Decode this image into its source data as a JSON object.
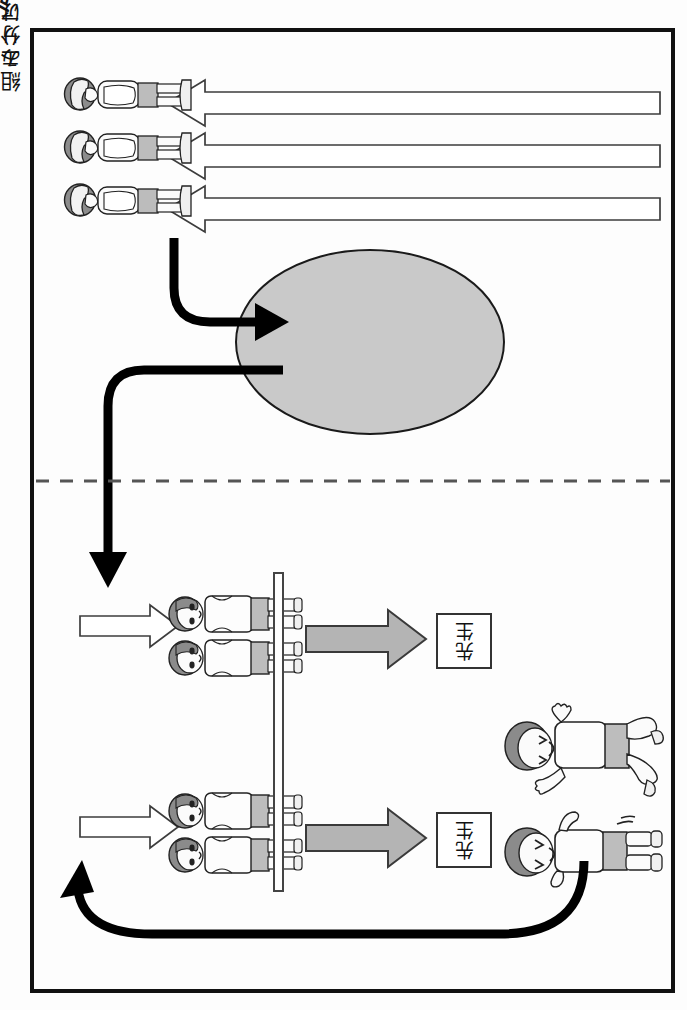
{
  "page": {
    "caption": "問題 1",
    "background_color": "#fdfdfd",
    "frame_color": "#111111"
  },
  "diagram": {
    "sorting_area": {
      "label_line1": "組み分け",
      "label_line2": "エリア",
      "fill_color": "#c9c9c9",
      "stroke_color": "#1a1a1a"
    },
    "teacher_boxes": [
      {
        "label": "先生"
      },
      {
        "label": "先生"
      }
    ],
    "divider": {
      "style": "dashed",
      "color": "#555555"
    },
    "walls": [
      {
        "name": "partition"
      }
    ],
    "figure_groups": {
      "queue_top": {
        "count": 3,
        "description": "待機している生徒"
      },
      "pair_upper": {
        "count": 2,
        "description": "組になった生徒"
      },
      "pair_lower": {
        "count": 2,
        "description": "組になった生徒"
      },
      "exiting": {
        "count": 2,
        "description": "走り出す生徒"
      }
    },
    "arrows": {
      "white_long_left": {
        "count": 3,
        "direction": "left",
        "fill": "#ffffff",
        "stroke": "#333333"
      },
      "white_short_right": {
        "count": 2,
        "direction": "right",
        "fill": "#ffffff",
        "stroke": "#333333"
      },
      "gray_right": {
        "count": 2,
        "direction": "right",
        "fill": "#b4b4b4",
        "stroke": "#333333"
      },
      "black_flow": {
        "count": 3,
        "description": "太い黒の流れ矢印",
        "color": "#000000"
      }
    }
  }
}
